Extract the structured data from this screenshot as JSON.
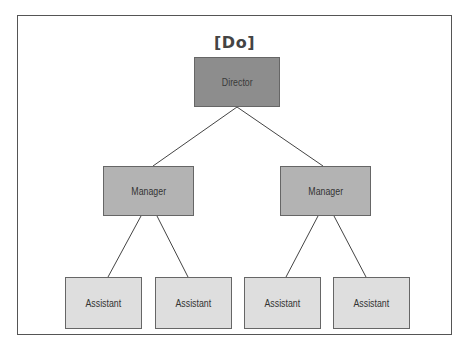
{
  "diagram": {
    "title": "[Do]",
    "type": "org-chart",
    "colors": {
      "frame": "#555555",
      "director": "#8d8d8d",
      "manager": "#b3b3b3",
      "assistant": "#dedede",
      "line": "#444444"
    },
    "nodes": [
      {
        "id": "director",
        "label": "Director",
        "level": 0
      },
      {
        "id": "manager-left",
        "label": "Manager",
        "level": 1,
        "parent": "director"
      },
      {
        "id": "manager-right",
        "label": "Manager",
        "level": 1,
        "parent": "director"
      },
      {
        "id": "assistant-1",
        "label": "Assistant",
        "level": 2,
        "parent": "manager-left"
      },
      {
        "id": "assistant-2",
        "label": "Assistant",
        "level": 2,
        "parent": "manager-left"
      },
      {
        "id": "assistant-3",
        "label": "Assistant",
        "level": 2,
        "parent": "manager-right"
      },
      {
        "id": "assistant-4",
        "label": "Assistant",
        "level": 2,
        "parent": "manager-right"
      }
    ]
  }
}
